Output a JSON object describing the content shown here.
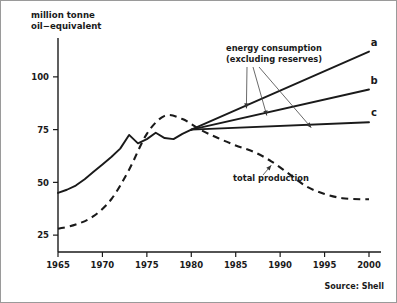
{
  "figure": {
    "source_note": "Source: Shell",
    "y_axis_title_line1": "million tonne",
    "y_axis_title_line2": "oil−equivalent"
  },
  "annotations": {
    "consumption_line1": "energy consumption",
    "consumption_line2": "(excluding reserves)",
    "production_label": "total production"
  },
  "chart_data": {
    "type": "line",
    "title": "",
    "xlabel": "",
    "ylabel": "million tonne oil−equivalent",
    "xlim": [
      1965,
      2000
    ],
    "ylim": [
      17,
      117
    ],
    "xticks": [
      1965,
      1970,
      1975,
      1980,
      1985,
      1990,
      1995,
      2000
    ],
    "xtick_labels": [
      "1965",
      "1970",
      "1975",
      "1980",
      "1985",
      "1990",
      "1995",
      "2000"
    ],
    "yticks": [
      25,
      50,
      75,
      100
    ],
    "ytick_labels": [
      "25",
      "50",
      "75",
      "100"
    ],
    "grid": false,
    "legend_position": "inline-annotations",
    "series": [
      {
        "name": "energy consumption historical",
        "style": "solid",
        "label": "",
        "x": [
          1965,
          1966,
          1967,
          1968,
          1969,
          1970,
          1971,
          1972,
          1973,
          1974,
          1975,
          1976,
          1977,
          1978,
          1979,
          1980
        ],
        "values": [
          45.0,
          46.5,
          48.5,
          51.5,
          55.0,
          58.5,
          62.0,
          66.0,
          72.5,
          68.5,
          70.5,
          73.5,
          71.0,
          70.5,
          73.0,
          75.0
        ]
      },
      {
        "name": "energy consumption projection a",
        "style": "solid",
        "label": "a",
        "x": [
          1980,
          2000
        ],
        "values": [
          75.0,
          112.0
        ]
      },
      {
        "name": "energy consumption projection b",
        "style": "solid",
        "label": "b",
        "x": [
          1980,
          2000
        ],
        "values": [
          75.0,
          94.0
        ]
      },
      {
        "name": "energy consumption projection c",
        "style": "solid",
        "label": "c",
        "x": [
          1980,
          2000
        ],
        "values": [
          75.0,
          78.5
        ]
      },
      {
        "name": "total production",
        "style": "dashed",
        "label": "",
        "x": [
          1965,
          1967,
          1969,
          1971,
          1973,
          1975,
          1977,
          1979,
          1981,
          1983,
          1985,
          1987,
          1989,
          1991,
          1993,
          1995,
          1997,
          1999,
          2000
        ],
        "values": [
          28.0,
          30.0,
          34.0,
          42.0,
          56.0,
          73.0,
          81.5,
          80.0,
          75.0,
          71.0,
          67.5,
          64.5,
          60.0,
          54.0,
          48.0,
          44.5,
          42.5,
          42.0,
          42.0
        ]
      }
    ]
  }
}
